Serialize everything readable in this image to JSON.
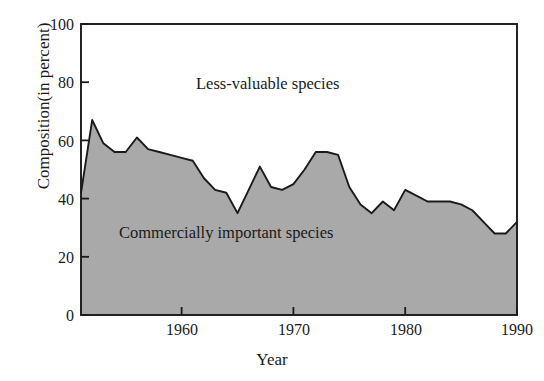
{
  "chart_data": {
    "type": "area",
    "title": "",
    "xlabel": "Year",
    "ylabel": "Composition(in percent)",
    "xlim": [
      1951,
      1990
    ],
    "ylim": [
      0,
      100
    ],
    "grid": false,
    "legend_position": "inline-annotations",
    "xticks": [
      1960,
      1970,
      1980,
      1990
    ],
    "xtick_labels": [
      "1960",
      "1970",
      "1980",
      "1990"
    ],
    "yticks": [
      0,
      20,
      40,
      60,
      80,
      100
    ],
    "ytick_labels": [
      "0",
      "20",
      "40",
      "60",
      "80",
      "100"
    ],
    "annotations": [
      {
        "text": "Less-valuable species",
        "x": 1964,
        "y": 80
      },
      {
        "text": "Commercially important species",
        "x": 1960,
        "y": 27
      }
    ],
    "series": [
      {
        "name": "Commercially important species",
        "fill_color": "#a9a9a9",
        "line_color": "#1a1a1a",
        "x": [
          1951,
          1952,
          1953,
          1954,
          1955,
          1956,
          1957,
          1958,
          1959,
          1960,
          1961,
          1962,
          1963,
          1964,
          1965,
          1966,
          1967,
          1968,
          1969,
          1970,
          1971,
          1972,
          1973,
          1974,
          1975,
          1976,
          1977,
          1978,
          1979,
          1980,
          1981,
          1982,
          1983,
          1984,
          1985,
          1986,
          1987,
          1988,
          1989,
          1990
        ],
        "values": [
          42,
          67,
          59,
          56,
          56,
          61,
          57,
          56,
          55,
          54,
          53,
          47,
          43,
          42,
          35,
          43,
          51,
          44,
          43,
          45,
          50,
          56,
          56,
          55,
          44,
          38,
          35,
          39,
          36,
          43,
          41,
          39,
          39,
          39,
          38,
          36,
          32,
          28,
          28,
          32
        ]
      }
    ],
    "colors": {
      "fill": "#a9a9a9",
      "outline": "#1a1a1a",
      "axis": "#1a1a1a",
      "background": "#ffffff",
      "text": "#1a1a1a"
    }
  },
  "axis": {
    "y_title": "Composition(in percent)",
    "x_title": "Year",
    "y_labels": [
      "100",
      "80",
      "60",
      "40",
      "20",
      "0"
    ],
    "x_labels": [
      "1960",
      "1970",
      "1980",
      "1990"
    ]
  },
  "annotations": {
    "upper": "Less-valuable species",
    "lower": "Commercially important species"
  }
}
